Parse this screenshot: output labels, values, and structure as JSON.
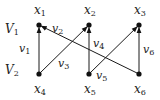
{
  "diagram": {
    "type": "bipartite-directed-graph",
    "nodes": [
      {
        "id": "x1",
        "label": "x",
        "sub": "1",
        "x": 39,
        "y": 25,
        "label_x": 34,
        "label_y": 14
      },
      {
        "id": "x2",
        "label": "x",
        "sub": "2",
        "x": 89,
        "y": 25,
        "label_x": 84,
        "label_y": 14
      },
      {
        "id": "x3",
        "label": "x",
        "sub": "3",
        "x": 139,
        "y": 25,
        "label_x": 134,
        "label_y": 14
      },
      {
        "id": "x4",
        "label": "x",
        "sub": "4",
        "x": 39,
        "y": 74,
        "label_x": 34,
        "label_y": 93
      },
      {
        "id": "x5",
        "label": "x",
        "sub": "5",
        "x": 89,
        "y": 74,
        "label_x": 84,
        "label_y": 93
      },
      {
        "id": "x6",
        "label": "x",
        "sub": "6",
        "x": 139,
        "y": 74,
        "label_x": 134,
        "label_y": 93
      }
    ],
    "edges": [
      {
        "id": "v1",
        "label": "v",
        "sub": "1",
        "from": "x4",
        "to": "x1",
        "label_x": 19,
        "label_y": 52
      },
      {
        "id": "v2",
        "label": "v",
        "sub": "2",
        "from": "x6",
        "to": "x1",
        "label_x": 52,
        "label_y": 32
      },
      {
        "id": "v3",
        "label": "v",
        "sub": "3",
        "from": "x4",
        "to": "x2",
        "label_x": 58,
        "label_y": 67
      },
      {
        "id": "v4",
        "label": "v",
        "sub": "4",
        "from": "x5",
        "to": "x2",
        "label_x": 93,
        "label_y": 47
      },
      {
        "id": "v5",
        "label": "v",
        "sub": "5",
        "from": "x5",
        "to": "x3",
        "label_x": 96,
        "label_y": 79
      },
      {
        "id": "v6",
        "label": "v",
        "sub": "6",
        "from": "x6",
        "to": "x3",
        "label_x": 143,
        "label_y": 53
      }
    ],
    "groups": [
      {
        "id": "V1",
        "label": "V",
        "sub": "1",
        "label_x": 5,
        "label_y": 33
      },
      {
        "id": "V2",
        "label": "V",
        "sub": "2",
        "label_x": 5,
        "label_y": 74
      }
    ]
  }
}
